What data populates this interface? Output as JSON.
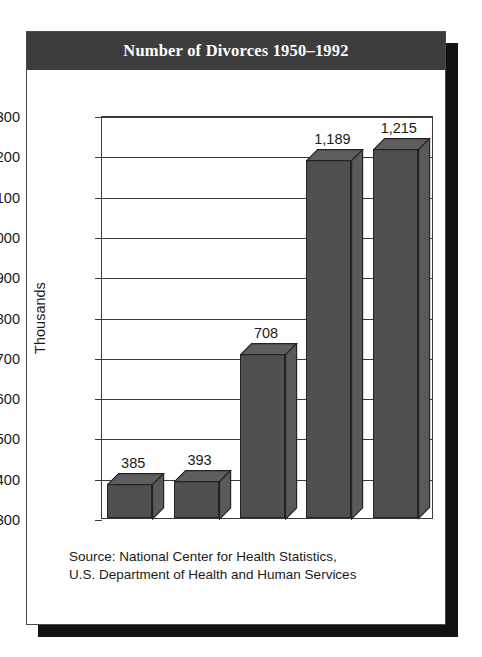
{
  "card": {
    "title": "Number of Divorces 1950–1992"
  },
  "source": {
    "line1": "Source: National Center for Health Statistics,",
    "line2": "U.S. Department of Health and Human Services"
  },
  "colors": {
    "title_bar": "#3d3d3d",
    "title_text": "#ffffff",
    "bar_front": "#4f4f4f",
    "bar_top": "#5e5e5e",
    "bar_side": "#5a5a5a",
    "axis": "#3a3a3a",
    "card_background": "#ffffff",
    "shadow": "#111111"
  },
  "chart_data": {
    "type": "bar",
    "title": "Number of Divorces 1950–1992",
    "categories": [
      "1950",
      "1960",
      "1970",
      "1980",
      "1992"
    ],
    "values": [
      385,
      393,
      708,
      1189,
      1215
    ],
    "value_labels": [
      "385",
      "393",
      "708",
      "1,189",
      "1,215"
    ],
    "xlabel": "",
    "ylabel": "Thousands",
    "ylim": [
      300,
      1300
    ],
    "ytick_step": 100,
    "ytick_labels": [
      "1,300",
      "1,200",
      "1,100",
      "1,000",
      "900",
      "800",
      "700",
      "600",
      "500",
      "400",
      "300"
    ],
    "ytick_values": [
      1300,
      1200,
      1100,
      1000,
      900,
      800,
      700,
      600,
      500,
      400,
      300
    ],
    "grid": true,
    "legend": false,
    "style": "3d-column"
  }
}
